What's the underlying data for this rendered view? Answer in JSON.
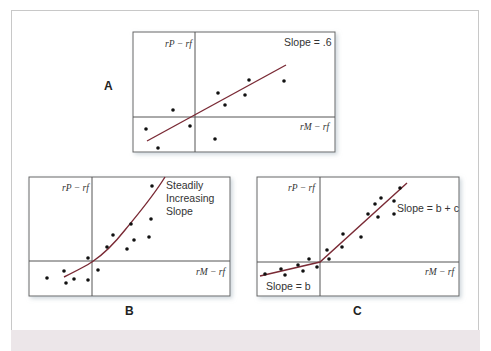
{
  "figure": {
    "panels": [
      {
        "id": "A",
        "label": "A",
        "y_axis_label": "rP − rf",
        "x_axis_label": "rM − rf",
        "annotation": "Slope = .6"
      },
      {
        "id": "B",
        "label": "B",
        "y_axis_label": "rP − rf",
        "x_axis_label": "rM − rf",
        "annotation_lines": [
          "Steadily",
          "Increasing",
          "Slope"
        ]
      },
      {
        "id": "C",
        "label": "C",
        "y_axis_label": "rP − rf",
        "x_axis_label": "rM − rf",
        "annotation_upper": "Slope = b + c",
        "annotation_lower": "Slope = b"
      }
    ],
    "colors": {
      "fit_line": "#7a2a35",
      "points": "#111111",
      "axes": "#555555",
      "box_border": "#666666"
    }
  }
}
